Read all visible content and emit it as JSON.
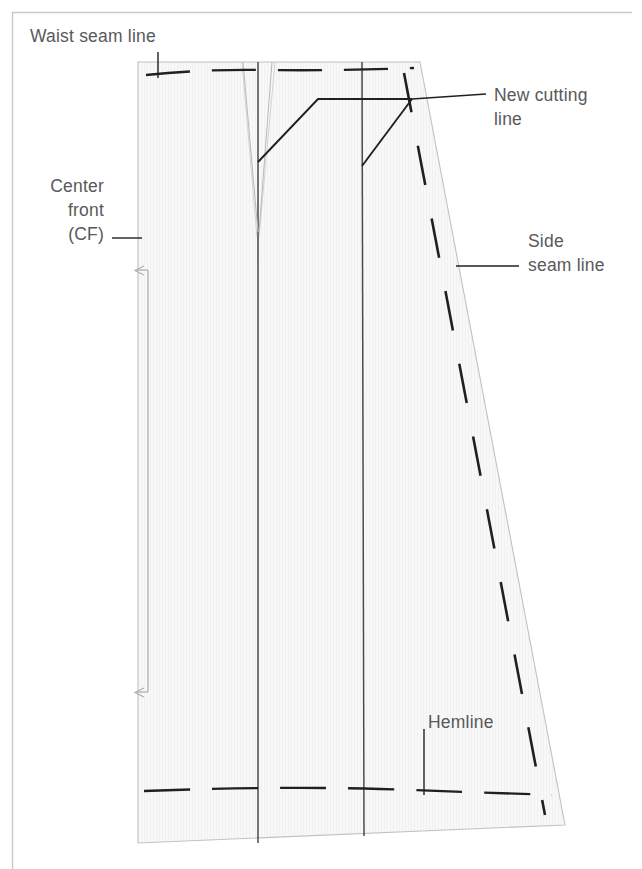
{
  "figure": {
    "kind": "sewing-pattern-diagram",
    "frame_color": "#c9c9c9",
    "paper_fill": "#f7f7f7",
    "line_color": "#231f20",
    "faint_line_color": "#b8b8b8",
    "label_color": "#58595b"
  },
  "labels": {
    "waist_seam": "Waist seam line",
    "center_front_line1": "Center",
    "center_front_line2": "front",
    "center_front_line3": "(CF)",
    "new_cutting_line1": "New cutting",
    "new_cutting_line2": "line",
    "side_seam_line1": "Side",
    "side_seam_line2": "seam line",
    "hemline": "Hemline"
  },
  "geometry": {
    "pattern_outline": "M138,62 L420,62 L565,825 L138,843 Z",
    "waist_seam_y": 73,
    "hemline_y": 791,
    "grainline_x": 148,
    "grainline_top_y": 268,
    "grainline_bottom_y": 694,
    "panel_line_1_x": 258,
    "panel_line_2_x": 362,
    "dart_apex_y": 232,
    "new_cutting_corner": [
      318,
      99
    ],
    "slash_origin_1": [
      258,
      162
    ],
    "slash_origin_2": [
      362,
      166
    ]
  }
}
